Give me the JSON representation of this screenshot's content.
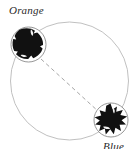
{
  "figure": {
    "type": "circle-diagram",
    "background_color": "#ffffff",
    "main_circle": {
      "name": "orbit-circle",
      "center_x": 69.5,
      "center_y": 81,
      "radius": 59,
      "stroke_color": "#b9b9b9",
      "stroke_width": 0.9,
      "fill": "none"
    },
    "connector": {
      "name": "dashed-connector",
      "x1": 40,
      "y1": 59,
      "x2": 100,
      "y2": 113,
      "stroke_color": "#a6a6a6",
      "stroke_width": 1.0,
      "dash_pattern": "4 3"
    },
    "nodes": [
      {
        "id": "orange",
        "label": "Orange",
        "label_x": 9,
        "label_y": 4,
        "circle_center_x": 28.5,
        "circle_center_y": 44.5,
        "circle_radius": 17.5,
        "circle_stroke": "#8a8a8a",
        "circle_stroke_width": 0.9,
        "blob_fill": "#111111",
        "blob_shape": "rounded-irregular"
      },
      {
        "id": "blue",
        "label": "Blue",
        "label_x": 103,
        "label_y": 140,
        "circle_center_x": 111,
        "circle_center_y": 120,
        "circle_radius": 17,
        "circle_stroke": "#8a8a8a",
        "circle_stroke_width": 0.9,
        "blob_fill": "#111111",
        "blob_shape": "angular-star"
      }
    ],
    "colors": {
      "blob": "#111111",
      "node_outline": "#8a8a8a",
      "orbit_outline": "#b9b9b9",
      "dash": "#a6a6a6",
      "label_text": "#2a2a2a"
    }
  }
}
